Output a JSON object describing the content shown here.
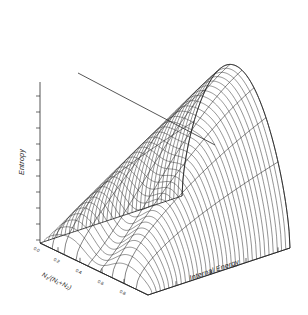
{
  "figure": {
    "kind": "3d-surface-wireframe",
    "background": "#ffffff",
    "line_color": "#3a3a3a",
    "axis_color": "#2b2b2b"
  },
  "axes": {
    "vertical": {
      "title": "Entropy",
      "orientation": "rotated-vertical",
      "tick_count": 10,
      "tick_labels": []
    },
    "right": {
      "title": "Internal Energy",
      "orientation": "rotated-diagonal",
      "tick_count": 4,
      "tick_labels": []
    },
    "left": {
      "title": "N₁/(N₁+N₂)",
      "orientation": "rotated-diagonal",
      "tick_count": 5,
      "tick_labels": [
        "0.0",
        "0.2",
        "0.4",
        "0.6",
        "0.8"
      ]
    }
  },
  "chart_data": {
    "type": "line",
    "title": "",
    "subtitle": "",
    "xlabel": "Internal Energy",
    "ylabel": "Entropy",
    "zlabel": "N₁/(N₁+N₂)",
    "grid": false,
    "legend": [],
    "legend_position": "none",
    "xlim": [
      0,
      1
    ],
    "ylim": [
      0,
      1
    ],
    "zlim": [
      0,
      1
    ],
    "mesh_line_count": 34,
    "rib_curve_count": 9,
    "annotations": [
      {
        "name": "tangent-ridge-line",
        "kind": "straight-line",
        "from": [
          78,
          73
        ],
        "to": [
          215,
          145
        ]
      }
    ],
    "series": [
      {
        "name": "entropy-surface",
        "description": "Entropy surface over internal energy and composition fraction; arch-shaped ridge with a cusp descending to the baseline near the front centre.",
        "values": []
      }
    ]
  }
}
